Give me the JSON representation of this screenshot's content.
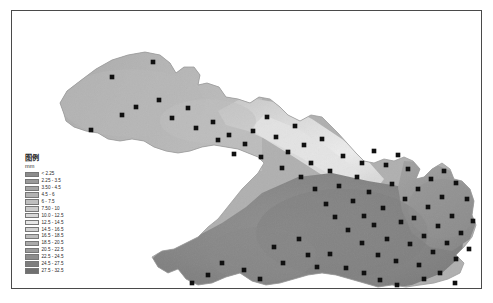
{
  "figure": {
    "kind": "thematic-choropleth-map",
    "border_color": "#4a4a4a",
    "background": "#ffffff"
  },
  "legend": {
    "title": "图例",
    "unit": "mm",
    "classes": [
      {
        "label": "< 2.25",
        "color": "#8c8c8c",
        "min": 0,
        "max": 2.25
      },
      {
        "label": "2.25 - 3.5",
        "color": "#9a9a9a",
        "min": 2.25,
        "max": 3.5
      },
      {
        "label": "3.50 - 4.5",
        "color": "#a6a6a6",
        "min": 3.5,
        "max": 4.5
      },
      {
        "label": "4.5 - 6",
        "color": "#b2b2b2",
        "min": 4.5,
        "max": 6
      },
      {
        "label": "6 - 7.5",
        "color": "#bfbfbf",
        "min": 6,
        "max": 7.5
      },
      {
        "label": "7.50 - 10",
        "color": "#cbcbcb",
        "min": 7.5,
        "max": 10
      },
      {
        "label": "10.0 - 12.5",
        "color": "#d8d8d8",
        "min": 10,
        "max": 12.5
      },
      {
        "label": "12.5 - 14.5",
        "color": "#e6e6e6",
        "min": 12.5,
        "max": 14.5
      },
      {
        "label": "14.5 - 16.5",
        "color": "#d2d2d2",
        "min": 14.5,
        "max": 16.5
      },
      {
        "label": "16.5 - 18.5",
        "color": "#bcbcbc",
        "min": 16.5,
        "max": 18.5
      },
      {
        "label": "18.5 - 20.5",
        "color": "#aaaaaa",
        "min": 18.5,
        "max": 20.5
      },
      {
        "label": "20.5 - 22.5",
        "color": "#9b9b9b",
        "min": 20.5,
        "max": 22.5
      },
      {
        "label": "22.5 - 24.5",
        "color": "#8d8d8d",
        "min": 22.5,
        "max": 24.5
      },
      {
        "label": "24.5 - 27.5",
        "color": "#7e7e7e",
        "min": 24.5,
        "max": 27.5
      },
      {
        "label": "27.5 - 32.5",
        "color": "#707070",
        "min": 27.5,
        "max": 32.5
      }
    ]
  },
  "map": {
    "region_fill_default": "#b4b4b4",
    "region_outline": "#9a9a9a",
    "station_marker_color": "#101010",
    "station_marker_size": 2.3,
    "stations": [
      [
        79,
        119
      ],
      [
        100,
        66
      ],
      [
        110,
        104
      ],
      [
        124,
        96
      ],
      [
        141,
        51
      ],
      [
        147,
        89
      ],
      [
        160,
        107
      ],
      [
        176,
        97
      ],
      [
        184,
        117
      ],
      [
        201,
        111
      ],
      [
        206,
        129
      ],
      [
        217,
        124
      ],
      [
        222,
        143
      ],
      [
        233,
        133
      ],
      [
        241,
        120
      ],
      [
        249,
        146
      ],
      [
        255,
        106
      ],
      [
        264,
        126
      ],
      [
        270,
        157
      ],
      [
        276,
        141
      ],
      [
        283,
        115
      ],
      [
        289,
        166
      ],
      [
        292,
        134
      ],
      [
        299,
        152
      ],
      [
        303,
        178
      ],
      [
        310,
        128
      ],
      [
        314,
        193
      ],
      [
        318,
        160
      ],
      [
        323,
        206
      ],
      [
        327,
        175
      ],
      [
        331,
        145
      ],
      [
        336,
        219
      ],
      [
        341,
        190
      ],
      [
        345,
        166
      ],
      [
        350,
        232
      ],
      [
        352,
        205
      ],
      [
        357,
        181
      ],
      [
        362,
        214
      ],
      [
        366,
        244
      ],
      [
        371,
        197
      ],
      [
        375,
        228
      ],
      [
        380,
        173
      ],
      [
        384,
        250
      ],
      [
        389,
        211
      ],
      [
        393,
        188
      ],
      [
        398,
        233
      ],
      [
        402,
        207
      ],
      [
        407,
        254
      ],
      [
        412,
        225
      ],
      [
        416,
        196
      ],
      [
        421,
        241
      ],
      [
        426,
        215
      ],
      [
        430,
        186
      ],
      [
        435,
        232
      ],
      [
        440,
        205
      ],
      [
        444,
        248
      ],
      [
        449,
        222
      ],
      [
        287,
        228
      ],
      [
        296,
        244
      ],
      [
        305,
        256
      ],
      [
        262,
        236
      ],
      [
        271,
        252
      ],
      [
        318,
        243
      ],
      [
        334,
        257
      ],
      [
        352,
        262
      ],
      [
        368,
        269
      ],
      [
        385,
        274
      ],
      [
        232,
        259
      ],
      [
        248,
        268
      ],
      [
        210,
        252
      ],
      [
        196,
        264
      ],
      [
        180,
        272
      ],
      [
        412,
        268
      ],
      [
        428,
        262
      ],
      [
        443,
        272
      ],
      [
        457,
        238
      ],
      [
        461,
        210
      ],
      [
        455,
        188
      ],
      [
        444,
        172
      ],
      [
        432,
        160
      ],
      [
        419,
        168
      ],
      [
        406,
        178
      ],
      [
        396,
        158
      ],
      [
        386,
        144
      ],
      [
        374,
        154
      ],
      [
        362,
        140
      ],
      [
        350,
        152
      ]
    ]
  }
}
